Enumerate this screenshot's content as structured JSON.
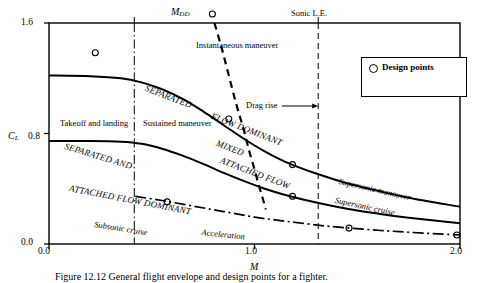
{
  "figure": {
    "caption": "Figure 12.12  General flight envelope and design points for a fighter."
  },
  "chart_data": {
    "type": "line",
    "title": "",
    "xlabel": "M",
    "ylabel": "C_L",
    "xlim": [
      0.0,
      2.0
    ],
    "ylim": [
      0.0,
      1.6
    ],
    "xticks": [
      "0.0",
      "1.0",
      "2.0"
    ],
    "xtick_values": [
      0.0,
      1.0,
      2.0
    ],
    "yticks": [
      "0.0",
      "0.8",
      "1.6"
    ],
    "ytick_values": [
      0.0,
      0.8,
      1.6
    ],
    "grid": false,
    "legend_position": "upper right",
    "series": [
      {
        "name": "Buffet / separated-flow boundary (upper)",
        "style": "solid",
        "points": [
          [
            0.0,
            1.22
          ],
          [
            0.2,
            1.215
          ],
          [
            0.35,
            1.2
          ],
          [
            0.45,
            1.17
          ],
          [
            0.55,
            1.12
          ],
          [
            0.65,
            1.05
          ],
          [
            0.75,
            0.96
          ],
          [
            0.85,
            0.86
          ],
          [
            0.95,
            0.76
          ],
          [
            1.05,
            0.67
          ],
          [
            1.15,
            0.595
          ],
          [
            1.3,
            0.51
          ],
          [
            1.45,
            0.44
          ],
          [
            1.6,
            0.385
          ],
          [
            1.75,
            0.335
          ],
          [
            2.0,
            0.27
          ]
        ]
      },
      {
        "name": "Attached-flow boundary (middle)",
        "style": "solid",
        "points": [
          [
            0.0,
            0.745
          ],
          [
            0.2,
            0.745
          ],
          [
            0.35,
            0.74
          ],
          [
            0.45,
            0.725
          ],
          [
            0.55,
            0.69
          ],
          [
            0.65,
            0.64
          ],
          [
            0.75,
            0.58
          ],
          [
            0.85,
            0.515
          ],
          [
            0.95,
            0.455
          ],
          [
            1.05,
            0.4
          ],
          [
            1.15,
            0.355
          ],
          [
            1.3,
            0.3
          ],
          [
            1.45,
            0.255
          ],
          [
            1.6,
            0.22
          ],
          [
            1.75,
            0.19
          ],
          [
            2.0,
            0.15
          ]
        ]
      },
      {
        "name": "Cruise line (lower, dash-dot)",
        "style": "dashdot",
        "points": [
          [
            0.42,
            0.345
          ],
          [
            0.55,
            0.315
          ],
          [
            0.7,
            0.275
          ],
          [
            0.85,
            0.235
          ],
          [
            1.0,
            0.195
          ],
          [
            1.15,
            0.165
          ],
          [
            1.35,
            0.13
          ],
          [
            1.55,
            0.105
          ],
          [
            1.75,
            0.085
          ],
          [
            2.0,
            0.065
          ]
        ]
      },
      {
        "name": "M_DD drag-divergence boundary",
        "style": "dashed",
        "points": [
          [
            0.805,
            1.6
          ],
          [
            0.84,
            1.42
          ],
          [
            0.875,
            1.22
          ],
          [
            0.91,
            1.02
          ],
          [
            0.945,
            0.84
          ],
          [
            0.975,
            0.67
          ],
          [
            1.0,
            0.54
          ],
          [
            1.02,
            0.43
          ],
          [
            1.04,
            0.33
          ],
          [
            1.055,
            0.25
          ]
        ]
      }
    ],
    "vertical_lines": [
      {
        "name": "low-speed boundary",
        "x": 0.415,
        "style": "dashdot"
      },
      {
        "name": "Sonic L.E.",
        "x": 1.31,
        "style": "dashed"
      }
    ],
    "design_points": [
      {
        "name": "takeoff-landing",
        "x": 0.225,
        "y": 1.385
      },
      {
        "name": "instantaneous-maneuver",
        "x": 0.795,
        "y": 1.665
      },
      {
        "name": "sustained-maneuver",
        "x": 0.875,
        "y": 0.905
      },
      {
        "name": "mixed-attached",
        "x": 1.185,
        "y": 0.575
      },
      {
        "name": "supersonic-maneuver",
        "x": 1.185,
        "y": 0.345
      },
      {
        "name": "subsonic-cruise",
        "x": 0.575,
        "y": 0.305
      },
      {
        "name": "acceleration",
        "x": 1.46,
        "y": 0.115
      },
      {
        "name": "supersonic-cruise",
        "x": 1.985,
        "y": 0.065
      }
    ],
    "annotations": [
      {
        "name": "mdd-label",
        "text": "M",
        "sub": "DD"
      },
      {
        "name": "sonic-le-label",
        "text": "Sonic L.E."
      },
      {
        "name": "instantaneous-maneuver-label",
        "text": "Instantaneous maneuver"
      },
      {
        "name": "drag-rise-label",
        "text": "Drag rise"
      },
      {
        "name": "takeoff-landing-label",
        "text": "Takeoff and landing"
      },
      {
        "name": "sustained-maneuver-label",
        "text": "Sustained maneuver"
      },
      {
        "name": "separated-label",
        "text": "SEPARATED"
      },
      {
        "name": "flow-dominant-label",
        "text": "FLOW DOMINANT"
      },
      {
        "name": "separated-and-label",
        "text": "SEPARATED AND"
      },
      {
        "name": "mixed-label",
        "text": "MIXED"
      },
      {
        "name": "attached-flow-label",
        "text": "ATTACHED FLOW"
      },
      {
        "name": "attached-flow-dominant-label",
        "text": "ATTACHED FLOW DOMINANT"
      },
      {
        "name": "subsonic-cruise-label",
        "text": "Subsonic cruise"
      },
      {
        "name": "acceleration-label",
        "text": "Acceleration"
      },
      {
        "name": "supersonic-maneuver-label",
        "text": "Supersonic maneuver"
      },
      {
        "name": "supersonic-cruise-label",
        "text": "Supersonic cruise"
      }
    ],
    "legend": {
      "marker": "open-circle",
      "label": "Design points"
    }
  },
  "axis": {
    "y_title_main": "C",
    "y_title_sub": "L",
    "x_title": "M",
    "y_top": "1.6",
    "y_mid": "0.8",
    "y_bottom": "0.0",
    "x_left": "0.0",
    "x_mid": "1.0",
    "x_right": "2.0"
  },
  "colors": {
    "ink": "#000000",
    "paper": "#ffffff"
  }
}
